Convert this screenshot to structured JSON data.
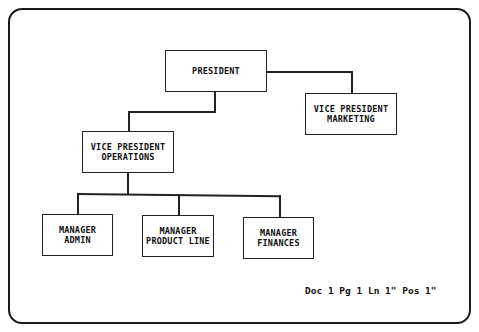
{
  "diagram": {
    "type": "org-chart",
    "nodes": {
      "president": {
        "lines": [
          "PRESIDENT"
        ]
      },
      "vp_marketing": {
        "lines": [
          "VICE PRESIDENT",
          "MARKETING"
        ]
      },
      "vp_operations": {
        "lines": [
          "VICE PRESIDENT",
          "OPERATIONS"
        ]
      },
      "mgr_admin": {
        "lines": [
          "MANAGER",
          "ADMIN"
        ]
      },
      "mgr_product_line": {
        "lines": [
          "MANAGER",
          "PRODUCT LINE"
        ]
      },
      "mgr_finances": {
        "lines": [
          "MANAGER",
          "FINANCES"
        ]
      }
    },
    "edges": [
      [
        "president",
        "vp_marketing"
      ],
      [
        "president",
        "vp_operations"
      ],
      [
        "vp_operations",
        "mgr_admin"
      ],
      [
        "vp_operations",
        "mgr_product_line"
      ],
      [
        "vp_operations",
        "mgr_finances"
      ]
    ]
  },
  "status_bar": {
    "text": "Doc 1 Pg 1 Ln 1\" Pos 1\""
  }
}
